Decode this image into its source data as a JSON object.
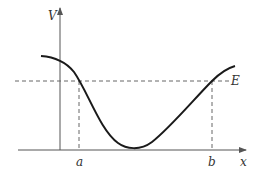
{
  "diagram": {
    "type": "potential-energy-curve",
    "labels": {
      "y_axis": "V",
      "x_axis": "x",
      "energy_level": "E",
      "left_turning_point": "a",
      "right_turning_point": "b"
    },
    "colors": {
      "curve": "#1a1a1a",
      "axes": "#555555",
      "dashed": "#666666",
      "text": "#333333"
    }
  }
}
